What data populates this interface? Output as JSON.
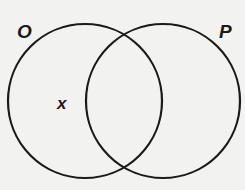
{
  "diagram": {
    "type": "venn",
    "sets": [
      {
        "label": "O",
        "cx": 85,
        "cy": 101,
        "r": 77
      },
      {
        "label": "P",
        "cx": 163,
        "cy": 101,
        "r": 77
      }
    ],
    "point": {
      "label": "x",
      "region": "O only",
      "x": 66,
      "y": 109
    },
    "colors": {
      "stroke": "#1a1a1a",
      "background": "#f2f2f0"
    }
  }
}
